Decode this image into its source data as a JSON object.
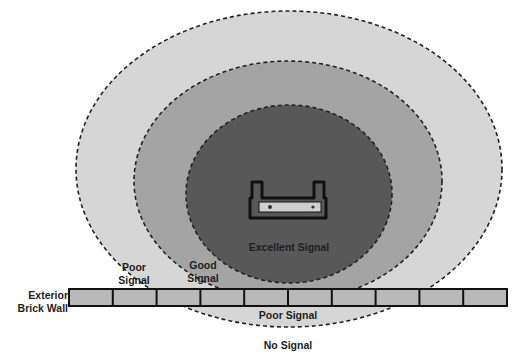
{
  "diagram": {
    "zones": [
      {
        "id": "no-signal",
        "label": "No Signal",
        "color": "#ffffff"
      },
      {
        "id": "poor",
        "label": "Poor Signal",
        "color": "#d4d4d4"
      },
      {
        "id": "good",
        "label": "Good Signal",
        "color": "#a6a6a6"
      },
      {
        "id": "excellent",
        "label": "Excellent Signal",
        "color": "#5a5a5a"
      }
    ],
    "labels": {
      "wall_line1": "Exterior",
      "wall_line2": "Brick Wall",
      "poor_line1": "Poor",
      "poor_line2": "Signal",
      "good_line1": "Good",
      "good_line2": "Signal",
      "excellent": "Excellent Signal",
      "poor_outside": "Poor Signal",
      "no_signal": "No Signal"
    },
    "wall": {
      "brick_count": 10,
      "brick_color": "#b9b9b9"
    },
    "router": {
      "icon": "router-icon"
    }
  }
}
